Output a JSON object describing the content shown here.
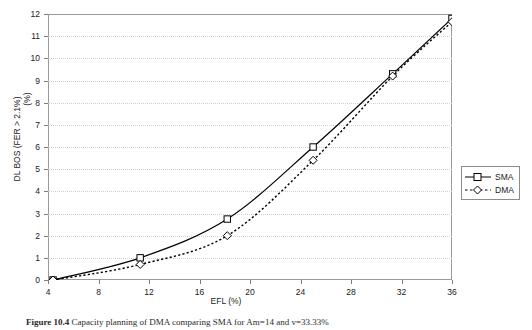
{
  "chart_data": {
    "type": "line",
    "title": "",
    "xlabel": "EFL (%)",
    "ylabel": "DL BOS (FER > 2.1%) (%)",
    "ylabel_line1": "DL BOS (FER > 2.1%)",
    "ylabel_line2": "(%)",
    "xlim": [
      4,
      36
    ],
    "ylim": [
      0,
      12
    ],
    "xticks": [
      4,
      8,
      12,
      16,
      20,
      24,
      28,
      32,
      36
    ],
    "yticks": [
      0,
      1,
      2,
      3,
      4,
      5,
      6,
      7,
      8,
      9,
      10,
      11,
      12
    ],
    "xtick_labels": [
      "4",
      "8",
      "12",
      "16",
      "20",
      "24",
      "28",
      "32",
      "36"
    ],
    "ytick_labels": [
      "0",
      "1",
      "2",
      "3",
      "4",
      "5",
      "6",
      "7",
      "8",
      "9",
      "10",
      "11",
      "12"
    ],
    "grid": "horizontal-dotted",
    "legend_position": "right-outside",
    "x": [
      4.4,
      11.3,
      18.2,
      25.0,
      31.3,
      36.0
    ],
    "series": [
      {
        "name": "SMA",
        "marker": "open-square",
        "line_style": "solid",
        "color": "#000000",
        "values": [
          0.0,
          1.0,
          2.75,
          6.0,
          9.3,
          11.8
        ]
      },
      {
        "name": "DMA",
        "marker": "open-diamond",
        "line_style": "dotted",
        "color": "#000000",
        "values": [
          0.0,
          0.7,
          2.0,
          5.4,
          9.2,
          11.65
        ]
      }
    ]
  },
  "legend": {
    "items": [
      {
        "label": "SMA"
      },
      {
        "label": "DMA"
      }
    ]
  },
  "caption": {
    "number": "Figure 10.4",
    "text": "Capacity planning of DMA comparing SMA for Am=14 and v=33.33%"
  }
}
